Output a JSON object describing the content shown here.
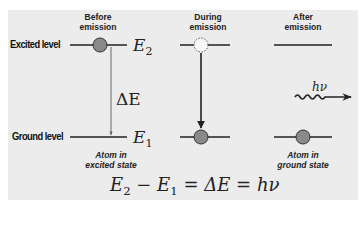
{
  "columns": [
    {
      "header_line1": "Before",
      "header_line2": "emission",
      "caption_line1": "Atom in",
      "caption_line2": "excited state"
    },
    {
      "header_line1": "During",
      "header_line2": "emission",
      "caption_line1": "",
      "caption_line2": ""
    },
    {
      "header_line1": "After",
      "header_line2": "emission",
      "caption_line1": "Atom in",
      "caption_line2": "ground state"
    }
  ],
  "levels": {
    "excited_label": "Excited level",
    "ground_label": "Ground level",
    "excited_symbol": "E",
    "excited_sub": "2",
    "ground_symbol": "E",
    "ground_sub": "1"
  },
  "delta_e": "ΔE",
  "photon_label": "hν",
  "equation": {
    "e2": "E",
    "e2_sub": "2",
    "minus": " − ",
    "e1": "E",
    "e1_sub": "1",
    "rest": " = ΔE = hν"
  },
  "colors": {
    "background": "#ececec",
    "line": "#222222",
    "electron_fill": "#8a8a8a",
    "arrow_gray": "#777777"
  }
}
